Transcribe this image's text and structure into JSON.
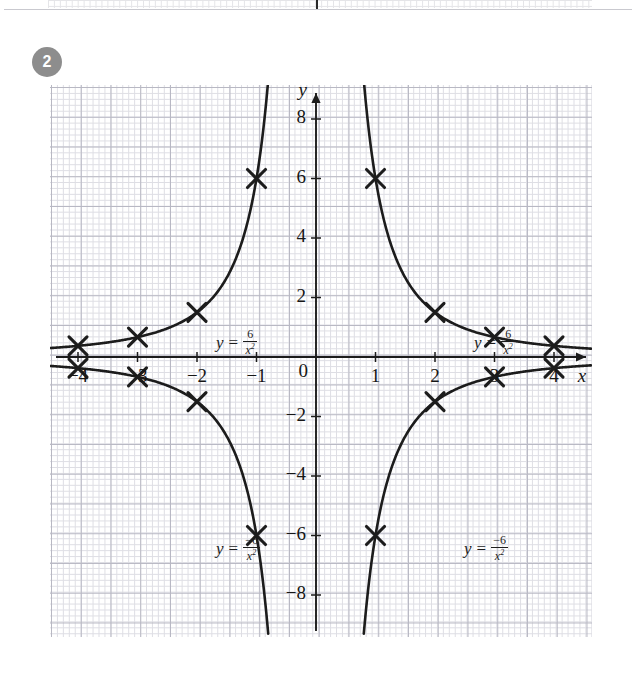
{
  "question": {
    "number": "2"
  },
  "chart_data": {
    "type": "line",
    "title": "",
    "xlabel": "x",
    "ylabel": "y",
    "xlim": [
      -4.6,
      4.6
    ],
    "ylim": [
      -9.2,
      9.2
    ],
    "grid": true,
    "grid_minor_step": 0.2,
    "grid_major_step": 1,
    "legend": "inline-annotations",
    "x_ticks": [
      -4,
      -3,
      -2,
      -1,
      0,
      1,
      2,
      3,
      4
    ],
    "x_tick_labels": [
      "−4",
      "−3",
      "−2",
      "−1",
      "0",
      "1",
      "2",
      "3",
      "4"
    ],
    "y_ticks": [
      -8,
      -6,
      -4,
      -2,
      2,
      4,
      6,
      8
    ],
    "y_tick_labels": [
      "−8",
      "−6",
      "−4",
      "−2",
      "2",
      "4",
      "6",
      "8"
    ],
    "series": [
      {
        "name": "y = 6/x²  (left branch)",
        "equation": "y = 6/x^2",
        "branch": "x<0",
        "marker": "x-cross",
        "x": [
          -4,
          -3,
          -2,
          -1,
          -0.82
        ],
        "values": [
          0.375,
          0.667,
          1.5,
          6,
          8.9
        ],
        "marked_points": [
          [
            -4,
            0.375
          ],
          [
            -3,
            0.667
          ],
          [
            -2,
            1.5
          ],
          [
            -1,
            6
          ]
        ]
      },
      {
        "name": "y = 6/x²  (right branch)",
        "equation": "y = 6/x^2",
        "branch": "x>0",
        "marker": "x-cross",
        "x": [
          0.82,
          1,
          2,
          3,
          4
        ],
        "values": [
          8.9,
          6,
          1.5,
          0.667,
          0.375
        ],
        "marked_points": [
          [
            1,
            6
          ],
          [
            2,
            1.5
          ],
          [
            3,
            0.667
          ],
          [
            4,
            0.375
          ]
        ]
      },
      {
        "name": "y = −6/x²  (left branch)",
        "equation": "y = -6/x^2",
        "branch": "x<0",
        "marker": "x-cross",
        "x": [
          -4,
          -3,
          -2,
          -1,
          -0.82
        ],
        "values": [
          -0.375,
          -0.667,
          -1.5,
          -6,
          -8.9
        ],
        "marked_points": [
          [
            -4,
            -0.375
          ],
          [
            -3,
            -0.667
          ],
          [
            -2,
            -1.5
          ],
          [
            -1,
            -6
          ]
        ]
      },
      {
        "name": "y = −6/x²  (right branch)",
        "equation": "y = -6/x^2",
        "branch": "x>0",
        "marker": "x-cross",
        "x": [
          0.82,
          1,
          2,
          3,
          4
        ],
        "values": [
          -8.9,
          -6,
          -1.5,
          -0.667,
          -0.375
        ],
        "marked_points": [
          [
            1,
            -6
          ],
          [
            2,
            -1.5
          ],
          [
            3,
            -0.667
          ],
          [
            4,
            -0.375
          ]
        ]
      }
    ],
    "annotations": [
      {
        "id": "upper-left",
        "lhs": "y",
        "eq": "=",
        "numerator": "6",
        "denominator": "x",
        "exponent": "2",
        "x": -2.5,
        "y": 3.8
      },
      {
        "id": "upper-right",
        "lhs": "y",
        "eq": "=",
        "numerator": "6",
        "denominator": "x",
        "exponent": "2",
        "x": 1.8,
        "y": 3.8
      },
      {
        "id": "lower-left",
        "lhs": "y",
        "eq": "=",
        "numerator": "−6",
        "denominator": "x",
        "exponent": "2",
        "x": -2.5,
        "y": -3.1
      },
      {
        "id": "lower-right",
        "lhs": "y",
        "eq": "=",
        "numerator": "−6",
        "denominator": "x",
        "exponent": "2",
        "x": 1.65,
        "y": -3.1
      }
    ]
  },
  "axes": {
    "x_label": "x",
    "y_label": "y",
    "x_tick_labels": [
      "−4",
      "−3",
      "−2",
      "−1",
      "0",
      "1",
      "2",
      "3",
      "4"
    ],
    "y_tick_labels": [
      "8",
      "6",
      "4",
      "2",
      "−2",
      "−4",
      "−6",
      "−8"
    ]
  },
  "colors": {
    "curve": "#1c1c1c",
    "axis": "#1c1c1c",
    "grid_minor": "#d9d9e0",
    "grid_major": "#b4b4c0",
    "badge_bg": "#8d8d8d",
    "badge_text": "#ffffff",
    "page_bg": "#ffffff"
  }
}
